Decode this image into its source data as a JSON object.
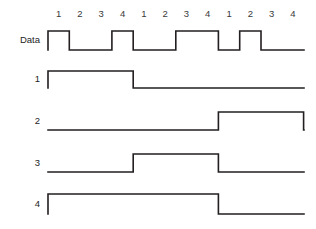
{
  "figure": {
    "background_color": "#ffffff",
    "line_color": "#231f20"
  },
  "geometry": {
    "origin_x": 48,
    "bit_width": 21.3,
    "total_bits": 12,
    "right_edge": 304
  },
  "axis": {
    "tick_label_y": 14,
    "tick_labels": [
      "1",
      "2",
      "3",
      "4",
      "1",
      "2",
      "3",
      "4",
      "1",
      "2",
      "3",
      "4"
    ]
  },
  "rows": [
    {
      "label": "Data",
      "name": "data",
      "baseline_y": 50,
      "high_y": 31,
      "bits": [
        1,
        0,
        0,
        1,
        0,
        0,
        1,
        1,
        0,
        1,
        0,
        0
      ]
    },
    {
      "label": "1",
      "name": "signal-1",
      "baseline_y": 88,
      "high_y": 71,
      "bits": [
        1,
        1,
        1,
        1,
        0,
        0,
        0,
        0,
        0,
        0,
        0,
        0
      ]
    },
    {
      "label": "2",
      "name": "signal-2",
      "baseline_y": 130,
      "high_y": 112,
      "bits": [
        0,
        0,
        0,
        0,
        0,
        0,
        0,
        0,
        1,
        1,
        1,
        1
      ]
    },
    {
      "label": "3",
      "name": "signal-3",
      "baseline_y": 172,
      "high_y": 154,
      "bits": [
        0,
        0,
        0,
        0,
        1,
        1,
        1,
        1,
        0,
        0,
        0,
        0
      ]
    },
    {
      "label": "4",
      "name": "signal-4",
      "baseline_y": 214,
      "high_y": 194,
      "bits": [
        1,
        1,
        1,
        1,
        1,
        1,
        1,
        1,
        0,
        0,
        0,
        0
      ]
    }
  ],
  "annotations": [
    {
      "name": "bit-period-T",
      "label": "T",
      "start_bit": 0,
      "end_bit": 1,
      "line_y": 55,
      "label_y": 64
    },
    {
      "name": "four-bit-period-4T",
      "label": "4T",
      "start_bit": 0,
      "end_bit": 4,
      "line_y": 93,
      "label_y": 102
    }
  ],
  "chart_data": {
    "type": "line",
    "xlabel": "",
    "ylabel": "",
    "x": [
      1,
      2,
      3,
      4,
      1,
      2,
      3,
      4,
      1,
      2,
      3,
      4
    ],
    "series": [
      {
        "name": "Data",
        "values": [
          1,
          0,
          0,
          1,
          0,
          0,
          1,
          1,
          0,
          1,
          0,
          0
        ]
      },
      {
        "name": "1",
        "values": [
          1,
          1,
          1,
          1,
          0,
          0,
          0,
          0,
          0,
          0,
          0,
          0
        ]
      },
      {
        "name": "2",
        "values": [
          0,
          0,
          0,
          0,
          0,
          0,
          0,
          0,
          1,
          1,
          1,
          1
        ]
      },
      {
        "name": "3",
        "values": [
          0,
          0,
          0,
          0,
          1,
          1,
          1,
          1,
          0,
          0,
          0,
          0
        ]
      },
      {
        "name": "4",
        "values": [
          1,
          1,
          1,
          1,
          1,
          1,
          1,
          1,
          0,
          0,
          0,
          0
        ]
      }
    ],
    "annotations": [
      "T",
      "4T"
    ],
    "grid": false,
    "legend": "none"
  }
}
